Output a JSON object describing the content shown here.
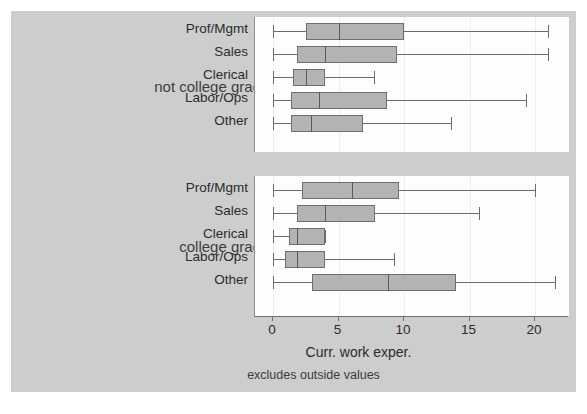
{
  "chart_data": {
    "type": "box",
    "title": "",
    "xlabel": "Curr. work exper.",
    "ylabel": "",
    "note": "excludes outside values",
    "xlim": [
      0,
      24
    ],
    "xticks": [
      0,
      5,
      10,
      15,
      20
    ],
    "xticklabels": [
      "0",
      "5",
      "10",
      "15",
      "20"
    ],
    "grid": false,
    "orientation": "horizontal",
    "box_fill": "#b3b3b3",
    "box_edge": "#6f6f6f",
    "panel_bg": "#fdfdfd",
    "figure_bg": "#cdcdcd",
    "groups": [
      {
        "name": "not college grad",
        "categories": [
          "Prof/Mgmt",
          "Sales",
          "Clerical",
          "Labor/Ops",
          "Other"
        ],
        "boxes": [
          {
            "category": "Prof/Mgmt",
            "min": 0.0,
            "q1": 2.5,
            "median": 5.0,
            "q3": 10.0,
            "max": 21.0
          },
          {
            "category": "Sales",
            "min": 0.0,
            "q1": 1.8,
            "median": 4.0,
            "q3": 9.5,
            "max": 21.0
          },
          {
            "category": "Clerical",
            "min": 0.0,
            "q1": 1.5,
            "median": 2.5,
            "q3": 4.0,
            "max": 7.7
          },
          {
            "category": "Labor/Ops",
            "min": 0.0,
            "q1": 1.4,
            "median": 3.5,
            "q3": 8.7,
            "max": 19.3
          },
          {
            "category": "Other",
            "min": 0.0,
            "q1": 1.4,
            "median": 2.9,
            "q3": 6.9,
            "max": 13.6
          }
        ]
      },
      {
        "name": "college grad",
        "categories": [
          "Prof/Mgmt",
          "Sales",
          "Clerical",
          "Labor/Ops",
          "Other"
        ],
        "boxes": [
          {
            "category": "Prof/Mgmt",
            "min": 0.0,
            "q1": 2.2,
            "median": 6.0,
            "q3": 9.6,
            "max": 20.0
          },
          {
            "category": "Sales",
            "min": 0.0,
            "q1": 1.8,
            "median": 4.0,
            "q3": 7.8,
            "max": 15.7
          },
          {
            "category": "Clerical",
            "min": 0.0,
            "q1": 1.2,
            "median": 1.8,
            "q3": 4.0,
            "max": 4.0
          },
          {
            "category": "Labor/Ops",
            "min": 0.0,
            "q1": 0.9,
            "median": 1.8,
            "q3": 4.0,
            "max": 9.2
          },
          {
            "category": "Other",
            "min": 0.0,
            "q1": 3.0,
            "median": 8.8,
            "q3": 14.0,
            "max": 21.5
          }
        ]
      }
    ]
  }
}
